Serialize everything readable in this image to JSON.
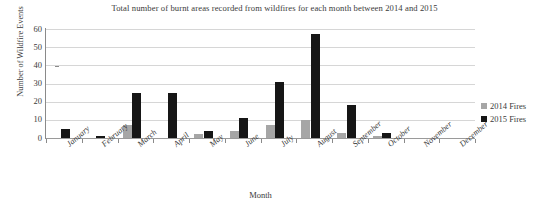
{
  "chart_data": {
    "type": "bar",
    "title": "Total number of burnt areas recorded from wildfires for each month between 2014 and 2015",
    "xlabel": "Month",
    "ylabel": "Number of Wildfire Events",
    "categories": [
      "January",
      "February",
      "March",
      "April",
      "May",
      "June",
      "July",
      "August",
      "September",
      "October",
      "November",
      "December"
    ],
    "series": [
      {
        "name": "2014 Fires",
        "color": "#a6a6a6",
        "values": [
          0,
          0,
          7,
          0,
          2,
          4,
          7,
          10,
          3,
          1,
          0,
          0
        ]
      },
      {
        "name": "2015 Fires",
        "color": "#161616",
        "values": [
          5,
          1,
          25,
          25,
          4,
          11,
          31,
          57,
          18,
          3,
          0,
          0
        ]
      }
    ],
    "ylim": [
      0,
      60
    ],
    "yticks": [
      0,
      10,
      20,
      30,
      40,
      50,
      60
    ],
    "ytick_labels": [
      "0",
      "10",
      "20",
      "30",
      "40",
      "50",
      "60"
    ],
    "grid": true,
    "legend_position": "right"
  },
  "legend": {
    "entries": [
      {
        "label": "2014 Fires",
        "color": "#a6a6a6"
      },
      {
        "label": "2015 Fires",
        "color": "#161616"
      }
    ]
  },
  "colors": {
    "series_2014": "#a6a6a6",
    "series_2015": "#161616",
    "gridline": "#d6d6d6",
    "axis": "#8a8a8a",
    "text": "#3a3a3a",
    "background": "#ffffff"
  }
}
